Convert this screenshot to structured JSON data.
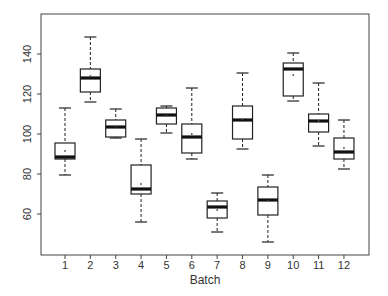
{
  "chart_data": {
    "type": "boxplot",
    "title": "",
    "xlabel": "Batch",
    "ylabel": "",
    "categories": [
      "1",
      "2",
      "3",
      "4",
      "5",
      "6",
      "7",
      "8",
      "9",
      "10",
      "11",
      "12"
    ],
    "yticks": [
      60,
      80,
      100,
      120,
      140
    ],
    "ylim": [
      40,
      160
    ],
    "grid": false,
    "legend": null,
    "boxes": [
      {
        "label": "1",
        "whisker_low": 79.5,
        "q1": 87.5,
        "median": 88.5,
        "q3": 95.5,
        "whisker_high": 113,
        "mean": 91.5
      },
      {
        "label": "2",
        "whisker_low": 116,
        "q1": 121,
        "median": 128,
        "q3": 132.5,
        "whisker_high": 148.5,
        "mean": 129
      },
      {
        "label": "3",
        "whisker_low": 98,
        "q1": 98.5,
        "median": 103.5,
        "q3": 107,
        "whisker_high": 112.5,
        "mean": 104
      },
      {
        "label": "4",
        "whisker_low": 56,
        "q1": 70,
        "median": 72.5,
        "q3": 84.5,
        "whisker_high": 97.5,
        "mean": 75
      },
      {
        "label": "5",
        "whisker_low": 100.5,
        "q1": 105,
        "median": 109.5,
        "q3": 113,
        "whisker_high": 114,
        "mean": 109
      },
      {
        "label": "6",
        "whisker_low": 87.5,
        "q1": 90.5,
        "median": 98.5,
        "q3": 105,
        "whisker_high": 123,
        "mean": 100
      },
      {
        "label": "7",
        "whisker_low": 51,
        "q1": 58,
        "median": 63.5,
        "q3": 66.5,
        "whisker_high": 70.5,
        "mean": 62
      },
      {
        "label": "8",
        "whisker_low": 92.5,
        "q1": 97.5,
        "median": 107,
        "q3": 114,
        "whisker_high": 130.5,
        "mean": 107.5
      },
      {
        "label": "9",
        "whisker_low": 46,
        "q1": 59.5,
        "median": 67,
        "q3": 73.5,
        "whisker_high": 79.5,
        "mean": 66.5
      },
      {
        "label": "10",
        "whisker_low": 116.5,
        "q1": 119,
        "median": 132.5,
        "q3": 135.5,
        "whisker_high": 140.5,
        "mean": 129.5
      },
      {
        "label": "11",
        "whisker_low": 94,
        "q1": 101,
        "median": 106.5,
        "q3": 110,
        "whisker_high": 125.5,
        "mean": 106.5
      },
      {
        "label": "12",
        "whisker_low": 82.5,
        "q1": 87.5,
        "median": 91,
        "q3": 98,
        "whisker_high": 107,
        "mean": 93
      }
    ]
  }
}
